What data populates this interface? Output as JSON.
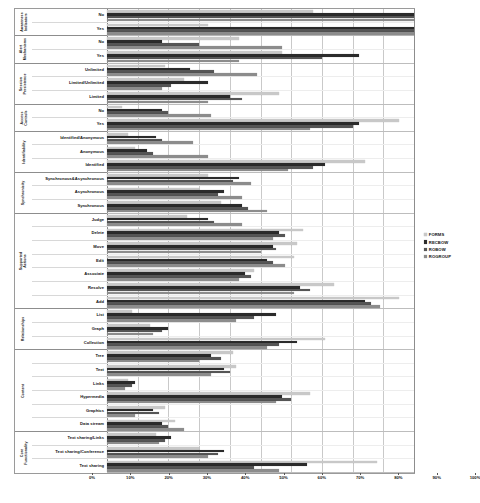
{
  "chart_data": {
    "type": "bar",
    "orientation": "horizontal",
    "title": "",
    "xlabel": "",
    "ylabel": "",
    "xlim": [
      0,
      100
    ],
    "xticks": [
      "0%",
      "10%",
      "20%",
      "30%",
      "40%",
      "50%",
      "60%",
      "70%",
      "80%",
      "90%",
      "100%"
    ],
    "xtick_values": [
      0,
      10,
      20,
      30,
      40,
      50,
      60,
      70,
      80,
      90,
      100
    ],
    "grid": true,
    "legend_position": "right",
    "series": [
      {
        "name": "FORMS",
        "color": "#c8c8c8"
      },
      {
        "name": "RECBOW",
        "color": "#2b2b2b"
      },
      {
        "name": "ROBOW",
        "color": "#555555"
      },
      {
        "name": "ROGROUP",
        "color": "#8c8c8c"
      }
    ],
    "groups": [
      {
        "label_line1": "Awareness",
        "label_line2": "Indicators",
        "rows": [
          {
            "category": "No",
            "values": [
              67,
              100,
              100,
              100
            ]
          },
          {
            "category": "Yes",
            "values": [
              33,
              100,
              100,
              100
            ]
          }
        ]
      },
      {
        "label_line1": "Alert",
        "label_line2": "Mechanisms",
        "rows": [
          {
            "category": "No",
            "values": [
              43,
              18,
              30,
              57
            ]
          },
          {
            "category": "Yes",
            "values": [
              57,
              82,
              70,
              43
            ]
          }
        ]
      },
      {
        "label_line1": "Session",
        "label_line2": "Persistence",
        "rows": [
          {
            "category": "Unlimited",
            "values": [
              19,
              27,
              35,
              49
            ]
          },
          {
            "category": "Limited/Unlimited",
            "values": [
              25,
              33,
              21,
              18
            ]
          },
          {
            "category": "Limited",
            "values": [
              56,
              40,
              44,
              33
            ]
          }
        ]
      },
      {
        "label_line1": "Access",
        "label_line2": "Controls",
        "rows": [
          {
            "category": "No",
            "values": [
              5,
              18,
              20,
              34
            ]
          },
          {
            "category": "Yes",
            "values": [
              95,
              82,
              80,
              66
            ]
          }
        ]
      },
      {
        "label_line1": "Identifiability",
        "label_line2": "",
        "rows": [
          {
            "category": "Identified/Anonymous",
            "values": [
              7,
              16,
              18,
              28
            ]
          },
          {
            "category": "Anonymous",
            "values": [
              9,
              13,
              15,
              33
            ]
          },
          {
            "category": "Identified",
            "values": [
              84,
              71,
              67,
              59
            ]
          }
        ]
      },
      {
        "label_line1": "Synchronicity",
        "label_line2": "",
        "rows": [
          {
            "category": "Synchronous&Asynchronous",
            "values": [
              33,
              43,
              41,
              47
            ]
          },
          {
            "category": "Asynchronous",
            "values": [
              30,
              38,
              36,
              44
            ]
          },
          {
            "category": "Synchronous",
            "values": [
              37,
              44,
              46,
              52
            ]
          }
        ]
      },
      {
        "label_line1": "Supported",
        "label_line2": "Actions",
        "rows": [
          {
            "category": "Judge",
            "values": [
              26,
              33,
              35,
              44
            ]
          },
          {
            "category": "Delete",
            "values": [
              64,
              56,
              58,
              54
            ]
          },
          {
            "category": "Move",
            "values": [
              62,
              54,
              55,
              50
            ]
          },
          {
            "category": "Edit",
            "values": [
              61,
              52,
              54,
              58
            ]
          },
          {
            "category": "Associate",
            "values": [
              48,
              45,
              47,
              43
            ]
          },
          {
            "category": "Resolve",
            "values": [
              74,
              63,
              66,
              61
            ]
          },
          {
            "category": "Add",
            "values": [
              95,
              84,
              86,
              89
            ]
          }
        ]
      },
      {
        "label_line1": "Relationships",
        "label_line2": "",
        "rows": [
          {
            "category": "List",
            "values": [
              8,
              55,
              48,
              42
            ]
          },
          {
            "category": "Graph",
            "values": [
              14,
              20,
              18,
              15
            ]
          },
          {
            "category": "Collection",
            "values": [
              71,
              62,
              56,
              52
            ]
          }
        ]
      },
      {
        "label_line1": "Content",
        "label_line2": "",
        "rows": [
          {
            "category": "Tree",
            "values": [
              41,
              34,
              37,
              30
            ]
          },
          {
            "category": "Text",
            "values": [
              42,
              38,
              40,
              34
            ]
          },
          {
            "category": "Links",
            "values": [
              7,
              9,
              8,
              6
            ]
          },
          {
            "category": "Hypermedia",
            "values": [
              66,
              57,
              60,
              55
            ]
          },
          {
            "category": "Graphics",
            "values": [
              19,
              15,
              17,
              9
            ]
          },
          {
            "category": "Data stream",
            "values": [
              22,
              18,
              20,
              25
            ]
          }
        ]
      },
      {
        "label_line1": "Core",
        "label_line2": "Functionality",
        "rows": [
          {
            "category": "Text sharing/Links",
            "values": [
              16,
              21,
              19,
              17
            ]
          },
          {
            "category": "Text sharing/Conference",
            "values": [
              30,
              38,
              36,
              33
            ]
          },
          {
            "category": "Text sharing",
            "values": [
              88,
              65,
              48,
              56
            ]
          }
        ]
      }
    ]
  }
}
